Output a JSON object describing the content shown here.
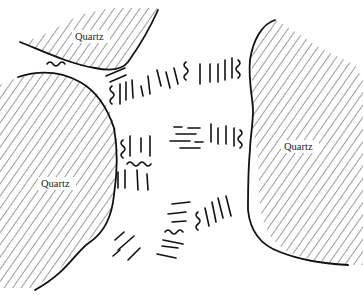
{
  "diagram": {
    "type": "thin-section sketch",
    "grains": [
      {
        "id": "quartz-top",
        "label": "Quartz"
      },
      {
        "id": "quartz-left",
        "label": "Quartz"
      },
      {
        "id": "quartz-right",
        "label": "Quartz"
      }
    ],
    "matrix_texture": "oriented mica flakes / sutured foliation between quartz grains",
    "colors": {
      "ink": "#111111",
      "background": "#ffffff"
    }
  }
}
